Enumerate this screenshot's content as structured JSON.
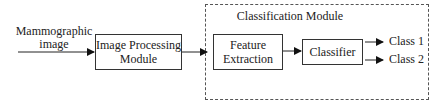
{
  "diagram": {
    "input_label_line1": "Mammographic",
    "input_label_line2": "image",
    "image_processing": {
      "line1": "Image Processing",
      "line2": "Module"
    },
    "classification_module": {
      "title": "Classification Module",
      "feature_extraction": {
        "line1": "Feature",
        "line2": "Extraction"
      },
      "classifier": "Classifier"
    },
    "outputs": [
      "Class 1",
      "Class 2"
    ]
  }
}
